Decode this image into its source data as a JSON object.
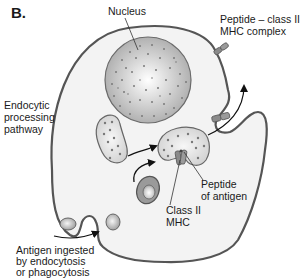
{
  "panel_label": "B.",
  "labels": {
    "nucleus": "Nucleus",
    "complex_line1": "Peptide – class II",
    "complex_line2": "MHC complex",
    "pathway_line1": "Endocytic",
    "pathway_line2": "processing",
    "pathway_line3": "pathway",
    "peptide_line1": "Peptide",
    "peptide_line2": "of antigen",
    "mhc_line1": "Class II",
    "mhc_line2": "MHC",
    "antigen_line1": "Antigen ingested",
    "antigen_line2": "by endocytosis",
    "antigen_line3": "or phagocytosis"
  },
  "colors": {
    "membrane": "#555555",
    "cytoplasm": "#f2f2f2",
    "nucleus_fill": "#c8c8c8",
    "dot": "#707070",
    "arrow": "#111111"
  }
}
